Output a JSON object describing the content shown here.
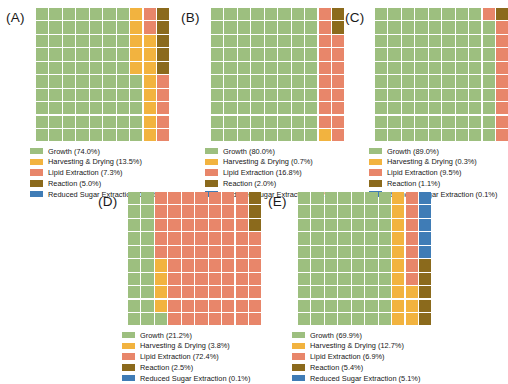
{
  "figure": {
    "type": "waffle-chart-grid",
    "panel_count": 5,
    "grid_rows": 10,
    "grid_cols": 10,
    "background": "#ffffff"
  },
  "colors": {
    "growth": "#9dbf7f",
    "harvesting_drying": "#f2b33f",
    "lipid_extraction": "#e8866a",
    "reaction": "#8b6a1c",
    "reduced_sugar_extraction": "#3f7cb6"
  },
  "category_keys": [
    "growth",
    "harvesting_drying",
    "lipid_extraction",
    "reaction",
    "reduced_sugar_extraction"
  ],
  "chart_data": [
    {
      "type": "waffle",
      "panel": "A",
      "label": "(A)",
      "rows": 10,
      "cols": 10,
      "categories": [
        "Growth",
        "Harvesting & Drying",
        "Lipid Extraction",
        "Reaction",
        "Reduced Sugar Extraction"
      ],
      "values": [
        74.0,
        13.5,
        7.3,
        5.0,
        0.2
      ],
      "units": "%",
      "legend": [
        {
          "label": "Growth (74.0%)",
          "color": "#9dbf7f",
          "key": "growth"
        },
        {
          "label": "Harvesting & Drying (13.5%)",
          "color": "#f2b33f",
          "key": "harvesting_drying"
        },
        {
          "label": "Lipid Extraction (7.3%)",
          "color": "#e8866a",
          "key": "lipid_extraction"
        },
        {
          "label": "Reaction (5.0%)",
          "color": "#8b6a1c",
          "key": "reaction"
        },
        {
          "label": "Reduced Sugar Extraction (0.2%)",
          "color": "#3f7cb6",
          "key": "reduced_sugar_extraction"
        }
      ],
      "cells": [
        "growth",
        "growth",
        "growth",
        "growth",
        "growth",
        "growth",
        "growth",
        "harvesting_drying",
        "lipid_extraction",
        "reaction",
        "growth",
        "growth",
        "growth",
        "growth",
        "growth",
        "growth",
        "growth",
        "harvesting_drying",
        "lipid_extraction",
        "reaction",
        "growth",
        "growth",
        "growth",
        "growth",
        "growth",
        "growth",
        "growth",
        "harvesting_drying",
        "harvesting_drying",
        "reaction",
        "growth",
        "growth",
        "growth",
        "growth",
        "growth",
        "growth",
        "growth",
        "harvesting_drying",
        "harvesting_drying",
        "reaction",
        "growth",
        "growth",
        "growth",
        "growth",
        "growth",
        "growth",
        "growth",
        "harvesting_drying",
        "harvesting_drying",
        "reaction",
        "growth",
        "growth",
        "growth",
        "growth",
        "growth",
        "growth",
        "growth",
        "growth",
        "harvesting_drying",
        "lipid_extraction",
        "growth",
        "growth",
        "growth",
        "growth",
        "growth",
        "growth",
        "growth",
        "growth",
        "harvesting_drying",
        "lipid_extraction",
        "growth",
        "growth",
        "growth",
        "growth",
        "growth",
        "growth",
        "growth",
        "growth",
        "harvesting_drying",
        "lipid_extraction",
        "growth",
        "growth",
        "growth",
        "growth",
        "growth",
        "growth",
        "growth",
        "growth",
        "harvesting_drying",
        "lipid_extraction",
        "growth",
        "growth",
        "growth",
        "growth",
        "growth",
        "growth",
        "growth",
        "growth",
        "harvesting_drying",
        "lipid_extraction"
      ]
    },
    {
      "type": "waffle",
      "panel": "B",
      "label": "(B)",
      "rows": 10,
      "cols": 10,
      "categories": [
        "Growth",
        "Harvesting & Drying",
        "Lipid Extraction",
        "Reaction",
        "Reduced Sugar Extraction"
      ],
      "values": [
        80.0,
        0.7,
        16.8,
        2.0,
        0.1
      ],
      "units": "%",
      "legend": [
        {
          "label": "Growth (80.0%)",
          "color": "#9dbf7f",
          "key": "growth"
        },
        {
          "label": "Harvesting & Drying (0.7%)",
          "color": "#f2b33f",
          "key": "harvesting_drying"
        },
        {
          "label": "Lipid Extraction (16.8%)",
          "color": "#e8866a",
          "key": "lipid_extraction"
        },
        {
          "label": "Reaction (2.0%)",
          "color": "#8b6a1c",
          "key": "reaction"
        },
        {
          "label": "Reduced Sugar Extraction (0.1%)",
          "color": "#3f7cb6",
          "key": "reduced_sugar_extraction"
        }
      ],
      "cells": [
        "growth",
        "growth",
        "growth",
        "growth",
        "growth",
        "growth",
        "growth",
        "growth",
        "lipid_extraction",
        "reaction",
        "growth",
        "growth",
        "growth",
        "growth",
        "growth",
        "growth",
        "growth",
        "growth",
        "lipid_extraction",
        "reaction",
        "growth",
        "growth",
        "growth",
        "growth",
        "growth",
        "growth",
        "growth",
        "growth",
        "lipid_extraction",
        "lipid_extraction",
        "growth",
        "growth",
        "growth",
        "growth",
        "growth",
        "growth",
        "growth",
        "growth",
        "lipid_extraction",
        "lipid_extraction",
        "growth",
        "growth",
        "growth",
        "growth",
        "growth",
        "growth",
        "growth",
        "growth",
        "lipid_extraction",
        "lipid_extraction",
        "growth",
        "growth",
        "growth",
        "growth",
        "growth",
        "growth",
        "growth",
        "growth",
        "lipid_extraction",
        "lipid_extraction",
        "growth",
        "growth",
        "growth",
        "growth",
        "growth",
        "growth",
        "growth",
        "growth",
        "lipid_extraction",
        "lipid_extraction",
        "growth",
        "growth",
        "growth",
        "growth",
        "growth",
        "growth",
        "growth",
        "growth",
        "lipid_extraction",
        "lipid_extraction",
        "growth",
        "growth",
        "growth",
        "growth",
        "growth",
        "growth",
        "growth",
        "growth",
        "lipid_extraction",
        "lipid_extraction",
        "growth",
        "growth",
        "growth",
        "growth",
        "growth",
        "growth",
        "growth",
        "growth",
        "harvesting_drying",
        "lipid_extraction"
      ]
    },
    {
      "type": "waffle",
      "panel": "C",
      "label": "(C)",
      "rows": 10,
      "cols": 10,
      "categories": [
        "Growth",
        "Harvesting & Drying",
        "Lipid Extraction",
        "Reaction",
        "Reduced Sugar Extraction"
      ],
      "values": [
        89.0,
        0.3,
        9.5,
        1.1,
        0.1
      ],
      "units": "%",
      "legend": [
        {
          "label": "Growth (89.0%)",
          "color": "#9dbf7f",
          "key": "growth"
        },
        {
          "label": "Harvesting & Drying (0.3%)",
          "color": "#f2b33f",
          "key": "harvesting_drying"
        },
        {
          "label": "Lipid Extraction (9.5%)",
          "color": "#e8866a",
          "key": "lipid_extraction"
        },
        {
          "label": "Reaction (1.1%)",
          "color": "#8b6a1c",
          "key": "reaction"
        },
        {
          "label": "Reduced Sugar Extraction (0.1%)",
          "color": "#3f7cb6",
          "key": "reduced_sugar_extraction"
        }
      ],
      "cells": [
        "growth",
        "growth",
        "growth",
        "growth",
        "growth",
        "growth",
        "growth",
        "growth",
        "lipid_extraction",
        "reaction",
        "growth",
        "growth",
        "growth",
        "growth",
        "growth",
        "growth",
        "growth",
        "growth",
        "growth",
        "lipid_extraction",
        "growth",
        "growth",
        "growth",
        "growth",
        "growth",
        "growth",
        "growth",
        "growth",
        "growth",
        "lipid_extraction",
        "growth",
        "growth",
        "growth",
        "growth",
        "growth",
        "growth",
        "growth",
        "growth",
        "growth",
        "lipid_extraction",
        "growth",
        "growth",
        "growth",
        "growth",
        "growth",
        "growth",
        "growth",
        "growth",
        "growth",
        "lipid_extraction",
        "growth",
        "growth",
        "growth",
        "growth",
        "growth",
        "growth",
        "growth",
        "growth",
        "growth",
        "lipid_extraction",
        "growth",
        "growth",
        "growth",
        "growth",
        "growth",
        "growth",
        "growth",
        "growth",
        "growth",
        "lipid_extraction",
        "growth",
        "growth",
        "growth",
        "growth",
        "growth",
        "growth",
        "growth",
        "growth",
        "growth",
        "lipid_extraction",
        "growth",
        "growth",
        "growth",
        "growth",
        "growth",
        "growth",
        "growth",
        "growth",
        "growth",
        "lipid_extraction",
        "growth",
        "growth",
        "growth",
        "growth",
        "growth",
        "growth",
        "growth",
        "growth",
        "growth",
        "lipid_extraction"
      ]
    },
    {
      "type": "waffle",
      "panel": "D",
      "label": "(D)",
      "rows": 10,
      "cols": 10,
      "categories": [
        "Growth",
        "Harvesting & Drying",
        "Lipid Extraction",
        "Reaction",
        "Reduced Sugar Extraction"
      ],
      "values": [
        21.2,
        3.8,
        72.4,
        2.5,
        0.1
      ],
      "units": "%",
      "legend": [
        {
          "label": "Growth (21.2%)",
          "color": "#9dbf7f",
          "key": "growth"
        },
        {
          "label": "Harvesting & Drying (3.8%)",
          "color": "#f2b33f",
          "key": "harvesting_drying"
        },
        {
          "label": "Lipid Extraction (72.4%)",
          "color": "#e8866a",
          "key": "lipid_extraction"
        },
        {
          "label": "Reaction (2.5%)",
          "color": "#8b6a1c",
          "key": "reaction"
        },
        {
          "label": "Reduced Sugar Extraction (0.1%)",
          "color": "#3f7cb6",
          "key": "reduced_sugar_extraction"
        }
      ],
      "cells": [
        "growth",
        "growth",
        "lipid_extraction",
        "lipid_extraction",
        "lipid_extraction",
        "lipid_extraction",
        "lipid_extraction",
        "lipid_extraction",
        "lipid_extraction",
        "reaction",
        "growth",
        "growth",
        "lipid_extraction",
        "lipid_extraction",
        "lipid_extraction",
        "lipid_extraction",
        "lipid_extraction",
        "lipid_extraction",
        "lipid_extraction",
        "reaction",
        "growth",
        "growth",
        "lipid_extraction",
        "lipid_extraction",
        "lipid_extraction",
        "lipid_extraction",
        "lipid_extraction",
        "lipid_extraction",
        "lipid_extraction",
        "reaction",
        "growth",
        "growth",
        "lipid_extraction",
        "lipid_extraction",
        "lipid_extraction",
        "lipid_extraction",
        "lipid_extraction",
        "lipid_extraction",
        "lipid_extraction",
        "lipid_extraction",
        "growth",
        "growth",
        "lipid_extraction",
        "lipid_extraction",
        "lipid_extraction",
        "lipid_extraction",
        "lipid_extraction",
        "lipid_extraction",
        "lipid_extraction",
        "lipid_extraction",
        "growth",
        "growth",
        "harvesting_drying",
        "lipid_extraction",
        "lipid_extraction",
        "lipid_extraction",
        "lipid_extraction",
        "lipid_extraction",
        "lipid_extraction",
        "lipid_extraction",
        "growth",
        "growth",
        "harvesting_drying",
        "lipid_extraction",
        "lipid_extraction",
        "lipid_extraction",
        "lipid_extraction",
        "lipid_extraction",
        "lipid_extraction",
        "lipid_extraction",
        "growth",
        "growth",
        "harvesting_drying",
        "lipid_extraction",
        "lipid_extraction",
        "lipid_extraction",
        "lipid_extraction",
        "lipid_extraction",
        "lipid_extraction",
        "lipid_extraction",
        "growth",
        "growth",
        "harvesting_drying",
        "lipid_extraction",
        "lipid_extraction",
        "lipid_extraction",
        "lipid_extraction",
        "lipid_extraction",
        "lipid_extraction",
        "lipid_extraction",
        "growth",
        "growth",
        "growth",
        "lipid_extraction",
        "lipid_extraction",
        "lipid_extraction",
        "lipid_extraction",
        "lipid_extraction",
        "lipid_extraction",
        "lipid_extraction"
      ]
    },
    {
      "type": "waffle",
      "panel": "E",
      "label": "(E)",
      "rows": 10,
      "cols": 10,
      "categories": [
        "Growth",
        "Harvesting & Drying",
        "Lipid Extraction",
        "Reaction",
        "Reduced Sugar Extraction"
      ],
      "values": [
        69.9,
        12.7,
        6.9,
        5.4,
        5.1
      ],
      "units": "%",
      "legend": [
        {
          "label": "Growth (69.9%)",
          "color": "#9dbf7f",
          "key": "growth"
        },
        {
          "label": "Harvesting & Drying (12.7%)",
          "color": "#f2b33f",
          "key": "harvesting_drying"
        },
        {
          "label": "Lipid Extraction (6.9%)",
          "color": "#e8866a",
          "key": "lipid_extraction"
        },
        {
          "label": "Reaction (5.4%)",
          "color": "#8b6a1c",
          "key": "reaction"
        },
        {
          "label": "Reduced Sugar Extraction (5.1%)",
          "color": "#3f7cb6",
          "key": "reduced_sugar_extraction"
        }
      ],
      "cells": [
        "growth",
        "growth",
        "growth",
        "growth",
        "growth",
        "growth",
        "growth",
        "harvesting_drying",
        "lipid_extraction",
        "reduced_sugar_extraction",
        "growth",
        "growth",
        "growth",
        "growth",
        "growth",
        "growth",
        "growth",
        "harvesting_drying",
        "lipid_extraction",
        "reduced_sugar_extraction",
        "growth",
        "growth",
        "growth",
        "growth",
        "growth",
        "growth",
        "growth",
        "harvesting_drying",
        "lipid_extraction",
        "reduced_sugar_extraction",
        "growth",
        "growth",
        "growth",
        "growth",
        "growth",
        "growth",
        "growth",
        "harvesting_drying",
        "lipid_extraction",
        "reduced_sugar_extraction",
        "growth",
        "growth",
        "growth",
        "growth",
        "growth",
        "growth",
        "growth",
        "harvesting_drying",
        "lipid_extraction",
        "reduced_sugar_extraction",
        "growth",
        "growth",
        "growth",
        "growth",
        "growth",
        "growth",
        "growth",
        "harvesting_drying",
        "lipid_extraction",
        "reaction",
        "growth",
        "growth",
        "growth",
        "growth",
        "growth",
        "growth",
        "growth",
        "harvesting_drying",
        "lipid_extraction",
        "reaction",
        "growth",
        "growth",
        "growth",
        "growth",
        "growth",
        "growth",
        "growth",
        "harvesting_drying",
        "harvesting_drying",
        "reaction",
        "growth",
        "growth",
        "growth",
        "growth",
        "growth",
        "growth",
        "growth",
        "harvesting_drying",
        "harvesting_drying",
        "reaction",
        "growth",
        "growth",
        "growth",
        "growth",
        "growth",
        "growth",
        "growth",
        "harvesting_drying",
        "harvesting_drying",
        "reaction"
      ]
    }
  ]
}
